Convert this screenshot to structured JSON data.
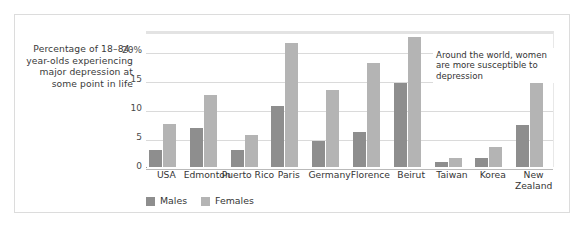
{
  "figure": {
    "y_caption": "Percentage of 18–84-year-olds experiencing major depression at some point in life",
    "annotation": "Around the world, women are more susceptible to depression"
  },
  "legend": {
    "items": [
      {
        "label": "Males",
        "color": "#8e8e8e",
        "swatch_name": "legend-swatch-males"
      },
      {
        "label": "Females",
        "color": "#b4b4b4",
        "swatch_name": "legend-swatch-females"
      }
    ]
  },
  "chart_data": {
    "type": "bar",
    "title": "",
    "subtitle": "",
    "xlabel": "",
    "ylabel": "Percentage of 18–84-year-olds experiencing major depression at some point in life",
    "ylim": [
      0,
      23.5
    ],
    "yticks": [
      0,
      5,
      10,
      15,
      20
    ],
    "ytick_labels": [
      "0",
      "5",
      "10",
      "15",
      "20%"
    ],
    "grid": true,
    "legend_position": "bottom-left",
    "annotations": [
      "Around the world, women are more susceptible to depression"
    ],
    "categories": [
      "USA",
      "Edmonton",
      "Puerto Rico",
      "Paris",
      "Germany",
      "Florence",
      "Beirut",
      "Taiwan",
      "Korea",
      "New Zealand"
    ],
    "series": [
      {
        "name": "Males",
        "color": "#8e8e8e",
        "values": [
          3.0,
          6.8,
          3.0,
          10.5,
          4.5,
          6.0,
          14.5,
          0.8,
          1.6,
          7.2
        ]
      },
      {
        "name": "Females",
        "color": "#b4b4b4",
        "values": [
          7.5,
          12.5,
          5.5,
          21.5,
          13.3,
          18.0,
          22.5,
          1.6,
          3.5,
          15.2
        ]
      }
    ]
  }
}
